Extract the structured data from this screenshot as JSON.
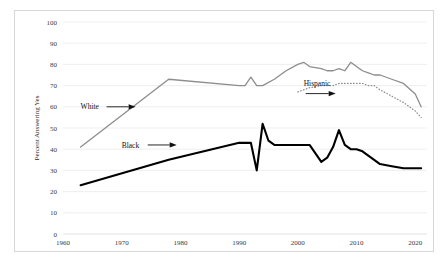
{
  "chart_data": {
    "type": "line",
    "title": "",
    "xlabel": "",
    "ylabel": "Percent Answering Yes",
    "xlim": [
      1960,
      2022
    ],
    "ylim": [
      0,
      100
    ],
    "xticks": [
      1960,
      1970,
      1980,
      1990,
      2000,
      2010,
      2020
    ],
    "yticks": [
      0,
      10,
      20,
      30,
      40,
      50,
      60,
      70,
      80,
      90,
      100
    ],
    "grid": true,
    "legend_position": "inline-annotations",
    "series": [
      {
        "name": "White",
        "style": "solid-gray",
        "color": "#8d8d8d",
        "x": [
          1963,
          1978,
          1990,
          1991,
          1992,
          1993,
          1994,
          1996,
          1998,
          2000,
          2001,
          2002,
          2004,
          2005,
          2006,
          2007,
          2008,
          2009,
          2010,
          2011,
          2012,
          2013,
          2014,
          2016,
          2018,
          2020,
          2021
        ],
        "y": [
          41,
          73,
          70,
          70,
          74,
          70,
          70,
          73,
          77,
          80,
          81,
          79,
          78,
          77,
          77,
          78,
          77,
          81,
          79,
          77,
          76,
          75,
          75,
          73,
          71,
          66,
          60
        ]
      },
      {
        "name": "Black",
        "style": "solid-black",
        "color": "#000000",
        "x": [
          1963,
          1978,
          1990,
          1991,
          1992,
          1993,
          1994,
          1995,
          1996,
          1998,
          2000,
          2001,
          2002,
          2004,
          2005,
          2006,
          2007,
          2008,
          2009,
          2010,
          2011,
          2012,
          2013,
          2014,
          2016,
          2018,
          2020,
          2021
        ],
        "y": [
          23,
          35,
          43,
          43,
          43,
          30,
          52,
          44,
          42,
          42,
          42,
          42,
          42,
          34,
          36,
          41,
          49,
          42,
          40,
          40,
          39,
          37,
          35,
          33,
          32,
          31,
          31,
          31
        ]
      },
      {
        "name": "Hispanic",
        "style": "dotted-gray",
        "color": "#8d8d8d",
        "x": [
          2000,
          2001,
          2002,
          2004,
          2005,
          2006,
          2007,
          2008,
          2009,
          2010,
          2011,
          2012,
          2013,
          2014,
          2016,
          2018,
          2020,
          2021
        ],
        "y": [
          67,
          68,
          69,
          70,
          70,
          70,
          71,
          71,
          71,
          71,
          71,
          70,
          70,
          68,
          65,
          62,
          58,
          55
        ]
      }
    ],
    "annotations": [
      {
        "label": "White",
        "x": 1963,
        "y": 60,
        "arrow": "right"
      },
      {
        "label": "Black",
        "x": 1970,
        "y": 42,
        "arrow": "right"
      },
      {
        "label": "Hispanic",
        "x": 2001,
        "y": 70,
        "arrow": "down-right"
      }
    ]
  }
}
